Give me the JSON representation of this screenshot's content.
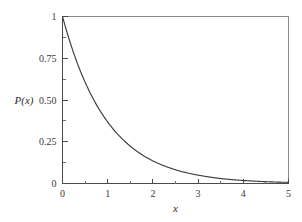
{
  "chart_data": {
    "type": "line",
    "title": "",
    "subtitle": "",
    "xlabel": "x",
    "ylabel": "P(x)",
    "xlim": [
      0,
      5
    ],
    "ylim": [
      0,
      1
    ],
    "grid": false,
    "legend": null,
    "legend_position": "none",
    "curve_color": "#3c3c3c",
    "axis_color": "#4a4a4a",
    "frame_color": "#8a8a8a",
    "background_color": "#ffffff",
    "x_ticks": [
      {
        "value": 0,
        "label": "0"
      },
      {
        "value": 1,
        "label": "1"
      },
      {
        "value": 2,
        "label": "2"
      },
      {
        "value": 3,
        "label": "3"
      },
      {
        "value": 4,
        "label": "4"
      },
      {
        "value": 5,
        "label": "5"
      }
    ],
    "x_minor_ticks": [
      0.5,
      1.5,
      2.5,
      3.5,
      4.5
    ],
    "y_ticks": [
      {
        "value": 0,
        "label": "0"
      },
      {
        "value": 0.25,
        "label": "0.25"
      },
      {
        "value": 0.5,
        "label": "0.50"
      },
      {
        "value": 0.75,
        "label": "0.75"
      },
      {
        "value": 1,
        "label": "1"
      }
    ],
    "y_minor_ticks": [
      0.125,
      0.375,
      0.625,
      0.875
    ],
    "series": [
      {
        "name": "P(x)",
        "function": "exp(-x)",
        "x": [
          0,
          0.1,
          0.2,
          0.3,
          0.4,
          0.5,
          0.6,
          0.7,
          0.8,
          0.9,
          1.0,
          1.1,
          1.2,
          1.3,
          1.4,
          1.5,
          1.6,
          1.7,
          1.8,
          1.9,
          2.0,
          2.2,
          2.4,
          2.6,
          2.8,
          3.0,
          3.2,
          3.4,
          3.6,
          3.8,
          4.0,
          4.2,
          4.4,
          4.6,
          4.8,
          5.0
        ],
        "values": [
          1.0,
          0.905,
          0.819,
          0.741,
          0.67,
          0.607,
          0.549,
          0.497,
          0.449,
          0.407,
          0.368,
          0.333,
          0.301,
          0.273,
          0.247,
          0.223,
          0.202,
          0.183,
          0.165,
          0.15,
          0.135,
          0.111,
          0.091,
          0.074,
          0.061,
          0.05,
          0.041,
          0.033,
          0.027,
          0.022,
          0.018,
          0.015,
          0.012,
          0.01,
          0.008,
          0.007
        ]
      }
    ]
  }
}
